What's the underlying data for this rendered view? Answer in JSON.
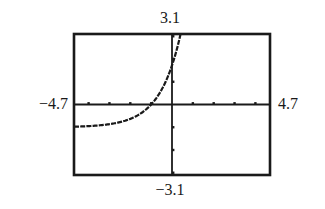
{
  "chart_data": {
    "type": "line",
    "title": "",
    "xlabel": "",
    "ylabel": "",
    "xlim": [
      -4.7,
      4.7
    ],
    "ylim": [
      -3.1,
      3.1
    ],
    "xscl": 1,
    "yscl": 1,
    "grid": false,
    "window_labels": {
      "xmin": "−4.7",
      "xmax": "4.7",
      "ymin": "−3.1",
      "ymax": "3.1"
    },
    "series": [
      {
        "name": "y = e^(x+1) - 1",
        "description": "exponential growth curve with horizontal asymptote y = -1, x-intercept near -1, y-intercept near 1.7",
        "x": [
          -4.7,
          -4.0,
          -3.5,
          -3.0,
          -2.5,
          -2.0,
          -1.5,
          -1.0,
          -0.5,
          0.0,
          0.2,
          0.41
        ],
        "y": [
          -0.98,
          -0.95,
          -0.92,
          -0.86,
          -0.78,
          -0.63,
          -0.39,
          0.0,
          0.65,
          1.72,
          2.32,
          3.1
        ]
      }
    ]
  },
  "colors": {
    "axis": "#1a1a1a",
    "curve": "#1a1a1a",
    "frame": "#1a1a1a",
    "background": "#ffffff"
  }
}
